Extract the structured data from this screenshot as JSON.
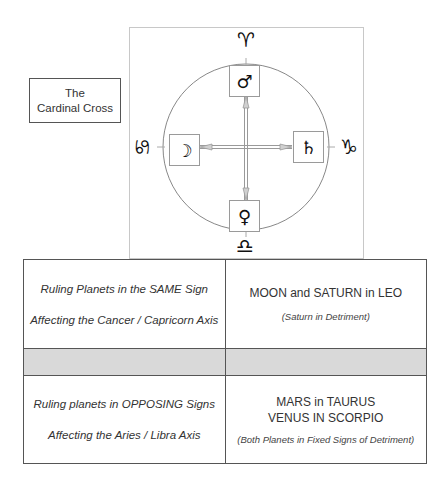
{
  "label": {
    "line1": "The",
    "line2": "Cardinal Cross"
  },
  "chart": {
    "signs": {
      "top": {
        "name": "Aries",
        "glyph": "♈"
      },
      "bottom": {
        "name": "Libra",
        "glyph": "♎"
      },
      "left": {
        "name": "Cancer",
        "glyph": "♋"
      },
      "right": {
        "name": "Capricorn",
        "glyph": "♑"
      }
    },
    "planets": {
      "top": {
        "name": "Mars",
        "glyph": "♂"
      },
      "bottom": {
        "name": "Venus",
        "glyph": "♀"
      },
      "left": {
        "name": "Moon",
        "glyph": "☽"
      },
      "right": {
        "name": "Saturn",
        "glyph": "♄"
      }
    },
    "colors": {
      "circle": "#888888",
      "cross": "#9a9a9a",
      "box_border": "#c8c8c8"
    }
  },
  "table": {
    "rows": [
      {
        "left": {
          "line1": "Ruling Planets in the SAME Sign",
          "line2": "Affecting the Cancer / Capricorn Axis"
        },
        "right": {
          "main1": "MOON and SATURN in LEO",
          "note": "(Saturn in Detriment)"
        }
      },
      {
        "shaded": true,
        "shade_color": "#d9d9d9"
      },
      {
        "left": {
          "line1": "Ruling planets in OPPOSING Signs",
          "line2": "Affecting the Aries / Libra Axis"
        },
        "right": {
          "main1": "MARS in TAURUS",
          "main2": "VENUS IN SCORPIO",
          "note": "(Both Planets in Fixed Signs of Detriment)"
        }
      }
    ]
  }
}
